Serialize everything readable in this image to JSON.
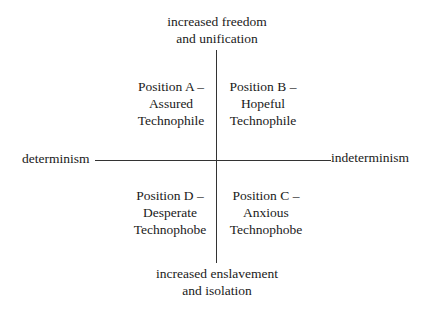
{
  "diagram": {
    "type": "quadrant",
    "axes": {
      "vertical": {
        "top": [
          "increased freedom",
          "and unification"
        ],
        "bottom": [
          "increased enslavement",
          "and isolation"
        ]
      },
      "horizontal": {
        "left": "determinism",
        "right": "indeterminism"
      }
    },
    "quadrants": {
      "top_left": [
        "Position A –",
        "Assured",
        "Technophile"
      ],
      "top_right": [
        "Position B –",
        "Hopeful",
        "Technophile"
      ],
      "bottom_right": [
        "Position C –",
        "Anxious",
        "Technophobe"
      ],
      "bottom_left": [
        "Position D –",
        "Desperate",
        "Technophobe"
      ]
    }
  }
}
